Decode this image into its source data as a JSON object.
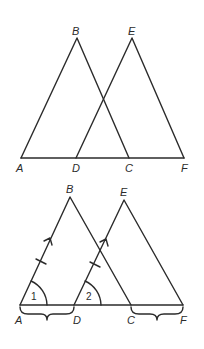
{
  "figures": [
    {
      "id": "top",
      "description": "Two overlapping triangles ABC and DEF sharing baseline AF",
      "points": {
        "A": {
          "label": "A",
          "x": 21,
          "y": 158
        },
        "B": {
          "label": "B",
          "x": 77,
          "y": 38
        },
        "C": {
          "label": "C",
          "x": 129,
          "y": 158
        },
        "D": {
          "label": "D",
          "x": 76,
          "y": 158
        },
        "E": {
          "label": "E",
          "x": 132,
          "y": 38
        },
        "F": {
          "label": "F",
          "x": 184,
          "y": 158
        }
      }
    },
    {
      "id": "bottom",
      "description": "Same triangles with congruence markings",
      "points": {
        "A": {
          "label": "A",
          "x": 20,
          "y": 305
        },
        "B": {
          "label": "B",
          "x": 70,
          "y": 197
        },
        "C": {
          "label": "C",
          "x": 131,
          "y": 305
        },
        "D": {
          "label": "D",
          "x": 74,
          "y": 305
        },
        "E": {
          "label": "E",
          "x": 124,
          "y": 200
        },
        "F": {
          "label": "F",
          "x": 183,
          "y": 305
        }
      },
      "angle_labels": {
        "angle1": "1",
        "angle2": "2"
      },
      "markings": [
        "tick on AB",
        "tick on DE",
        "parallel arrow on AB",
        "parallel arrow on DE",
        "brace under AD",
        "brace under CF"
      ]
    }
  ],
  "colors": {
    "stroke": "#2b2b2b",
    "background": "#ffffff"
  }
}
